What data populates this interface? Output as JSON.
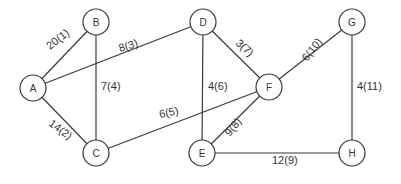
{
  "diagram": {
    "type": "weighted-undirected-graph",
    "nodes": [
      {
        "id": "A",
        "label": "A",
        "x": 33,
        "y": 88
      },
      {
        "id": "B",
        "label": "B",
        "x": 96,
        "y": 22
      },
      {
        "id": "C",
        "label": "C",
        "x": 96,
        "y": 153
      },
      {
        "id": "D",
        "label": "D",
        "x": 203,
        "y": 22
      },
      {
        "id": "E",
        "label": "E",
        "x": 202,
        "y": 153
      },
      {
        "id": "F",
        "label": "F",
        "x": 269,
        "y": 87
      },
      {
        "id": "G",
        "label": "G",
        "x": 352,
        "y": 22
      },
      {
        "id": "H",
        "label": "H",
        "x": 352,
        "y": 153
      }
    ],
    "edges": [
      {
        "from": "A",
        "to": "B",
        "label": "20(1)",
        "lx": 50,
        "ly": 50,
        "rot": -38
      },
      {
        "from": "A",
        "to": "C",
        "label": "14(2)",
        "lx": 48,
        "ly": 125,
        "rot": 36
      },
      {
        "from": "A",
        "to": "D",
        "label": "8(3)",
        "lx": 120,
        "ly": 52,
        "rot": -17
      },
      {
        "from": "B",
        "to": "C",
        "label": "7(4)",
        "lx": 101,
        "ly": 90,
        "rot": 0
      },
      {
        "from": "C",
        "to": "F",
        "label": "6(5)",
        "lx": 160,
        "ly": 118,
        "rot": -12
      },
      {
        "from": "D",
        "to": "E",
        "label": "4(6)",
        "lx": 208,
        "ly": 90,
        "rot": 0
      },
      {
        "from": "D",
        "to": "F",
        "label": "3(7)",
        "lx": 235,
        "ly": 44,
        "rot": 42
      },
      {
        "from": "E",
        "to": "F",
        "label": "9(8)",
        "lx": 230,
        "ly": 137,
        "rot": -52
      },
      {
        "from": "E",
        "to": "H",
        "label": "12(9)",
        "lx": 272,
        "ly": 164,
        "rot": 0
      },
      {
        "from": "F",
        "to": "G",
        "label": "6(10)",
        "lx": 307,
        "ly": 62,
        "rot": -52
      },
      {
        "from": "G",
        "to": "H",
        "label": "4(11)",
        "lx": 357,
        "ly": 90,
        "rot": 0
      }
    ],
    "style": {
      "node_radius": 13,
      "stroke_color": "#3a3a3a",
      "text_color": "#333333",
      "background": "#ffffff"
    }
  }
}
